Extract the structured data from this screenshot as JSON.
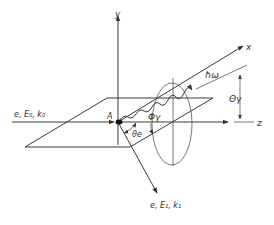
{
  "diagram": {
    "axes": {
      "x": "x",
      "y": "y",
      "z": "z"
    },
    "labels": {
      "incoming_electron": "e, E₀, k₀",
      "outgoing_electron": "e, E₁, k₁",
      "photon": "ħω",
      "theta_photon": "Θγ",
      "phi_photon": "Φγ",
      "theta_electron": "θe",
      "point_A": "A"
    },
    "colors": {
      "line": "#3a3a3a",
      "background": "#ffffff"
    }
  }
}
